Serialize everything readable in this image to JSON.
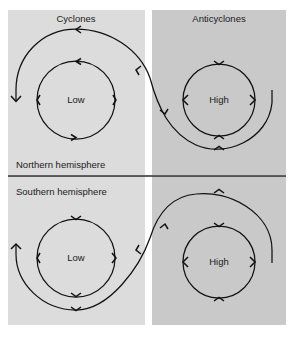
{
  "figure": {
    "title_row": {
      "cyclones_label": "Cyclones",
      "anticyclones_label": "Anticyclones"
    },
    "hemispheres": {
      "northern_label": "Northern hemisphere",
      "southern_label": "Southern hemisphere"
    },
    "pressure_centers": {
      "low_label": "Low",
      "high_label": "High"
    },
    "quadrants": [
      {
        "id": "northern-cyclone",
        "column_label": "Cyclones",
        "hemisphere_label": "Northern hemisphere",
        "center_label": "Low",
        "rotation": "counterclockwise",
        "background_color": "#dcdcdc"
      },
      {
        "id": "northern-anticyclone",
        "column_label": "Anticyclones",
        "hemisphere_label": "Northern hemisphere",
        "center_label": "High",
        "rotation": "clockwise",
        "background_color": "#c9c9c9"
      },
      {
        "id": "southern-cyclone",
        "column_label": "Cyclones",
        "hemisphere_label": "Southern hemisphere",
        "center_label": "Low",
        "rotation": "clockwise",
        "background_color": "#dcdcdc"
      },
      {
        "id": "southern-anticyclone",
        "column_label": "Anticyclones",
        "hemisphere_label": "Southern hemisphere",
        "center_label": "High",
        "rotation": "counterclockwise",
        "background_color": "#c9c9c9"
      }
    ],
    "colors": {
      "left_panel_bg": "#dcdcdc",
      "right_panel_bg": "#c9c9c9",
      "line_color": "#111111",
      "text_color": "#1a1a1a",
      "page_bg": "#ffffff"
    }
  }
}
